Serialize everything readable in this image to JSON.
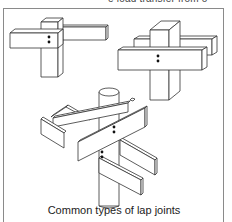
{
  "header": {
    "cropped_text": "e load transfer from o"
  },
  "figure": {
    "caption": "Common types of lap joints",
    "parts": [
      {
        "name": "corner-lap-joint",
        "description": "Two rectangular members overlapping at a corner with two bolts"
      },
      {
        "name": "cross-lap-joint",
        "description": "Horizontal members on both sides of a square post with two bolts"
      },
      {
        "name": "pole-lap-joint",
        "description": "Paired boards crossing a round pole, bolted at two levels"
      }
    ],
    "colors": {
      "stroke": "#333333",
      "fill": "#ffffff",
      "bolt": "#111111",
      "frame": "#8a8a8a"
    }
  }
}
